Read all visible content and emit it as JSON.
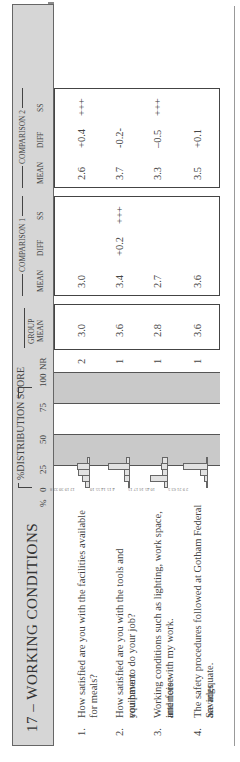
{
  "section": {
    "title": "17 – WORKING CONDITIONS"
  },
  "header": {
    "pct_label": "%",
    "distribution_label": "%DISTRIBUTION SCORE",
    "scale_ticks": [
      "0",
      "25",
      "50",
      "75",
      "100"
    ],
    "nr_label": "NR",
    "group_mean_label_1": "GROUP",
    "group_mean_label_2": "MEAN",
    "comparison1": {
      "title": "COMPARISON 1",
      "mean": "MEAN",
      "diff": "DIFF",
      "ss": "SS"
    },
    "comparison2": {
      "title": "COMPARISON 2",
      "mean": "MEAN",
      "diff": "DIFF",
      "ss": "SS"
    }
  },
  "rows": [
    {
      "num": "1.",
      "line1": "How satisfied are you with the facilities available for meals?",
      "line2": "",
      "dist": [
        12,
        19,
        30,
        32,
        8
      ],
      "dist_labels": [
        "12",
        "19",
        "30",
        "32",
        "8"
      ],
      "nr": "2",
      "group_mean": "3.0",
      "c1_mean": "3.0",
      "c1_diff": "",
      "c1_ss": "",
      "c2_mean": "2.6",
      "c2_diff": "+0.4",
      "c2_ss": "+++"
    },
    {
      "num": "2.",
      "line1": "How satisfied are you with the tools and equipment",
      "line2": "you have to do your job?",
      "dist": [
        4,
        15,
        14,
        55,
        10
      ],
      "dist_labels": [
        "4",
        "15",
        "14",
        "55",
        "10"
      ],
      "nr": "1",
      "group_mean": "3.6",
      "c1_mean": "3.4",
      "c1_diff": "+0.2",
      "c1_ss": "+++",
      "c2_mean": "3.7",
      "c2_diff": "-0.2-",
      "c2_ss": ""
    },
    {
      "num": "3.",
      "line1": "Working conditions such as lighting, work space, and noise",
      "line2": "interfere with my work.",
      "dist": [
        10,
        45,
        16,
        17,
        15
      ],
      "dist_labels": [
        "10",
        "45",
        "16",
        "17",
        "15"
      ],
      "nr": "1",
      "group_mean": "2.8",
      "c1_mean": "2.7",
      "c1_diff": "",
      "c1_ss": "",
      "c2_mean": "3.3",
      "c2_diff": "–0.5",
      "c2_ss": "+++"
    },
    {
      "num": "4.",
      "line1": "The safety procedures followed at Gotham Federal Savings",
      "line2": "are adequate.",
      "dist": [
        2,
        9,
        21,
        63,
        5
      ],
      "dist_labels": [
        "2",
        "9",
        "21",
        "63",
        "5"
      ],
      "nr": "1",
      "group_mean": "3.6",
      "c1_mean": "3.6",
      "c1_diff": "",
      "c1_ss": "",
      "c2_mean": "3.5",
      "c2_diff": "+0.1",
      "c2_ss": ""
    }
  ],
  "colors": {
    "band": "#d6d6d6",
    "stripe": "#c9c9c9",
    "bar_fill": "#e2e2e2",
    "text": "#444444"
  }
}
